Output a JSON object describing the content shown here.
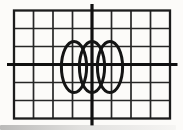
{
  "figure": {
    "background_color": "#fcfbf9",
    "grid_line_color": "#262626",
    "border_color": "#1c1c1c",
    "axis_color": "#101010",
    "trace_color": "#141414",
    "canvas": {
      "width": 183,
      "height": 130
    },
    "grid": {
      "x": 14,
      "y": 10.5,
      "width": 156,
      "height": 108,
      "cols": 8,
      "rows": 6,
      "line_width": 1.7,
      "border_width": 2.3
    },
    "axes": {
      "horizontal": {
        "y": 64.5,
        "x1": 7,
        "x2": 177.5,
        "stroke_width": 3.2
      },
      "vertical": {
        "x": 92,
        "y1": 4,
        "y2": 125.5,
        "stroke_width": 3.2
      }
    },
    "trace": {
      "type": "ellipse-train",
      "count": 3,
      "rx": 12.6,
      "ry": 25.6,
      "cy": 67,
      "centers_x": [
        74,
        92,
        110
      ],
      "stroke_width": 3
    },
    "scan_shadow_color": "#8c8c8c"
  }
}
